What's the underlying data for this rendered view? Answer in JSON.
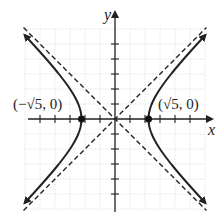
{
  "chart_data": {
    "type": "line",
    "title": "",
    "equation": "x^2 - y^2 = 5",
    "xlabel": "x",
    "ylabel": "y",
    "xlim": [
      -6,
      6
    ],
    "ylim": [
      -6,
      6
    ],
    "grid": true,
    "x_ticks": [
      -5,
      -4,
      -3,
      -2,
      -1,
      1,
      2,
      3,
      4,
      5
    ],
    "y_ticks": [
      -5,
      -4,
      -3,
      -2,
      -1,
      1,
      2,
      3,
      4,
      5
    ],
    "series": [
      {
        "name": "hyperbola",
        "style": "solid",
        "equation": "x^2 - y^2 = 5"
      },
      {
        "name": "asymptote y=x",
        "style": "dashed",
        "equation": "y = x"
      },
      {
        "name": "asymptote y=-x",
        "style": "dashed",
        "equation": "y = -x"
      }
    ],
    "points": [
      {
        "x": -2.236,
        "y": 0,
        "label": "(−√5, 0)"
      },
      {
        "x": 2.236,
        "y": 0,
        "label": "(√5, 0)"
      }
    ],
    "annotations": [
      "(−√5, 0)",
      "(√5, 0)"
    ]
  },
  "labels": {
    "x_axis": "x",
    "y_axis": "y",
    "left_vertex": "(−√5, 0)",
    "right_vertex": "(√5, 0)"
  }
}
